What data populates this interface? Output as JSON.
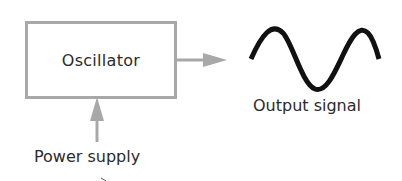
{
  "diagram": {
    "nodes": [
      {
        "id": "oscillator",
        "label": "Oscillator",
        "shape": "rectangle"
      }
    ],
    "inputs": [
      {
        "id": "power_supply",
        "label": "Power supply",
        "direction": "up-into-oscillator"
      }
    ],
    "outputs": [
      {
        "id": "output_signal",
        "label": "Output signal",
        "symbol": "sine-wave"
      }
    ],
    "edges": [
      {
        "from": "power_supply",
        "to": "oscillator"
      },
      {
        "from": "oscillator",
        "to": "output_signal"
      }
    ],
    "colors": {
      "box_border": "#a8a8a8",
      "arrow": "#a8a8a8",
      "wave": "#111111",
      "text": "#2b2b2b"
    }
  }
}
